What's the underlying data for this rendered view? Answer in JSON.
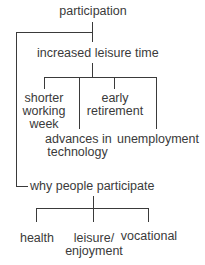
{
  "diagram": {
    "root": "participation",
    "branch1": {
      "label": "increased leisure time",
      "children": [
        {
          "line1": "shorter",
          "line2": "working",
          "line3": "week"
        },
        {
          "line1": "advances in",
          "line2": "technology"
        },
        {
          "line1": "early",
          "line2": "retirement"
        },
        {
          "line1": "unemployment"
        }
      ]
    },
    "branch2": {
      "label": "why people participate",
      "children": [
        {
          "line1": "health"
        },
        {
          "line1": "leisure/",
          "line2": "enjoyment"
        },
        {
          "line1": "vocational"
        }
      ]
    }
  }
}
